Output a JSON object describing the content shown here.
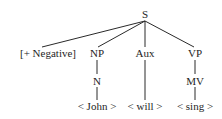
{
  "tree": {
    "root": {
      "label": "S"
    },
    "level1": {
      "negative": {
        "label": "[+ Negative]"
      },
      "np": {
        "label": "NP"
      },
      "aux": {
        "label": "Aux"
      },
      "vp": {
        "label": "VP"
      }
    },
    "level2": {
      "n": {
        "label": "N"
      },
      "mv": {
        "label": "MV"
      }
    },
    "leaves": {
      "john": {
        "label": "< John >"
      },
      "will": {
        "label": "< will >"
      },
      "sing": {
        "label": "< sing >"
      }
    }
  },
  "colors": {
    "line": "#2a2a2a",
    "text": "#1e1e1e",
    "background": "#ffffff"
  }
}
